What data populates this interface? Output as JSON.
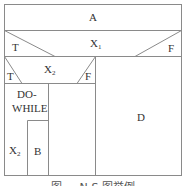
{
  "diagram": {
    "type": "N-S flowchart",
    "blocks": {
      "a": "A",
      "x1": {
        "label": "X",
        "sub": "1",
        "true": "T",
        "false": "F"
      },
      "x2": {
        "label": "X",
        "sub": "2",
        "true": "T",
        "false": "F"
      },
      "dowhile": {
        "line1": "DO-",
        "line2": "WHILE",
        "cond": "X",
        "cond_sub": "2",
        "body": "B"
      },
      "d": "D"
    },
    "caption": "图 ... N-S 图举例"
  }
}
